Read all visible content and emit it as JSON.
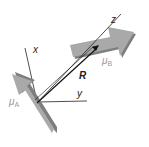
{
  "diagram": {
    "axes": {
      "x_label": "x",
      "y_label": "y",
      "z_label": "z"
    },
    "vector_label": "R",
    "dipoles": [
      {
        "name": "mu_A",
        "symbol": "μ",
        "subscript": "A"
      },
      {
        "name": "mu_B",
        "symbol": "μ",
        "subscript": "B"
      }
    ],
    "colors": {
      "arrow_fill": "#a9a9a9",
      "arrow_shadow": "#7e7e7e",
      "line": "#222222",
      "label_grey": "#9a9a9a"
    }
  }
}
